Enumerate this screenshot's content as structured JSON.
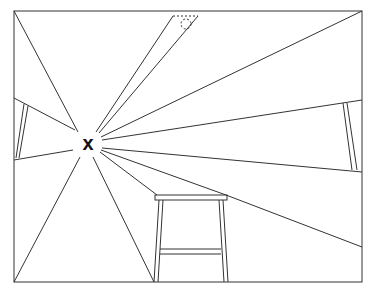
{
  "diagram": {
    "marker_label": "x",
    "colors": {
      "line": "#333333",
      "background": "#ffffff",
      "marker": "#111111"
    },
    "frame": {
      "left": 14,
      "top": 11,
      "right": 362,
      "bottom": 282
    },
    "viewpoint": {
      "x": 88,
      "y": 143
    }
  }
}
